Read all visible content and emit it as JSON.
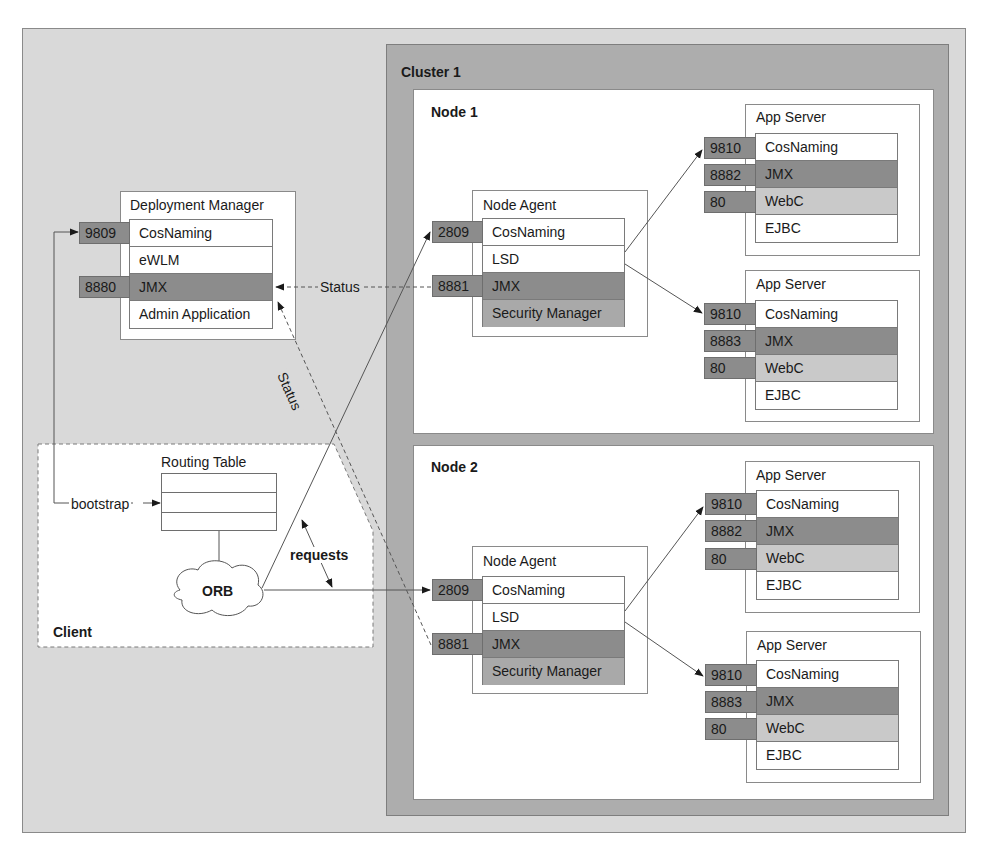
{
  "diagram": {
    "type": "architecture",
    "cluster": {
      "label": "Cluster 1"
    },
    "deployment_manager": {
      "title": "Deployment Manager",
      "rows": [
        {
          "label": "CosNaming",
          "port": "9809",
          "shade": "white"
        },
        {
          "label": "eWLM",
          "port": "",
          "shade": "white"
        },
        {
          "label": "JMX",
          "port": "8880",
          "shade": "dark"
        },
        {
          "label": "Admin Application",
          "port": "",
          "shade": "white"
        }
      ]
    },
    "nodes": [
      {
        "label": "Node 1",
        "node_agent": {
          "title": "Node Agent",
          "rows": [
            {
              "label": "CosNaming",
              "port": "2809",
              "shade": "white"
            },
            {
              "label": "LSD",
              "port": "",
              "shade": "white"
            },
            {
              "label": "JMX",
              "port": "8881",
              "shade": "dark"
            },
            {
              "label": "Security Manager",
              "port": "",
              "shade": "mid"
            }
          ]
        },
        "app_servers": [
          {
            "title": "App Server",
            "rows": [
              {
                "label": "CosNaming",
                "port": "9810",
                "shade": "white"
              },
              {
                "label": "JMX",
                "port": "8882",
                "shade": "dark"
              },
              {
                "label": "WebC",
                "port": "80",
                "shade": "light"
              },
              {
                "label": "EJBC",
                "port": "",
                "shade": "white"
              }
            ]
          },
          {
            "title": "App Server",
            "rows": [
              {
                "label": "CosNaming",
                "port": "9810",
                "shade": "white"
              },
              {
                "label": "JMX",
                "port": "8883",
                "shade": "dark"
              },
              {
                "label": "WebC",
                "port": "80",
                "shade": "light"
              },
              {
                "label": "EJBC",
                "port": "",
                "shade": "white"
              }
            ]
          }
        ]
      },
      {
        "label": "Node 2",
        "node_agent": {
          "title": "Node Agent",
          "rows": [
            {
              "label": "CosNaming",
              "port": "2809",
              "shade": "white"
            },
            {
              "label": "LSD",
              "port": "",
              "shade": "white"
            },
            {
              "label": "JMX",
              "port": "8881",
              "shade": "dark"
            },
            {
              "label": "Security Manager",
              "port": "",
              "shade": "mid"
            }
          ]
        },
        "app_servers": [
          {
            "title": "App Server",
            "rows": [
              {
                "label": "CosNaming",
                "port": "9810",
                "shade": "white"
              },
              {
                "label": "JMX",
                "port": "8882",
                "shade": "dark"
              },
              {
                "label": "WebC",
                "port": "80",
                "shade": "light"
              },
              {
                "label": "EJBC",
                "port": "",
                "shade": "white"
              }
            ]
          },
          {
            "title": "App Server",
            "rows": [
              {
                "label": "CosNaming",
                "port": "9810",
                "shade": "white"
              },
              {
                "label": "JMX",
                "port": "8883",
                "shade": "dark"
              },
              {
                "label": "WebC",
                "port": "80",
                "shade": "light"
              },
              {
                "label": "EJBC",
                "port": "",
                "shade": "white"
              }
            ]
          }
        ]
      }
    ],
    "client": {
      "label": "Client",
      "routing_table": {
        "title": "Routing Table",
        "rows": 3
      },
      "orb": {
        "label": "ORB"
      },
      "bootstrap_label": "bootstrap",
      "requests_label": "requests"
    },
    "connectors": {
      "status_horizontal": "Status",
      "status_diagonal": "Status"
    },
    "colors": {
      "outer_bg": "#d9d9d9",
      "cluster_bg": "#adadad",
      "node_bg": "#ffffff",
      "port_badge": "#8c8c8c",
      "jmx_row": "#8c8c8c",
      "security_row": "#a9a9a9",
      "webc_row": "#c9c9c9"
    }
  }
}
